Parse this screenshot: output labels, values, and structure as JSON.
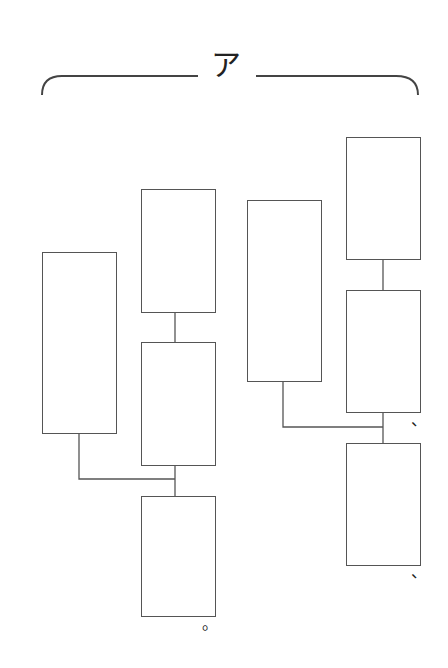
{
  "diagram": {
    "title": "ア",
    "bracket": {
      "type": "curly-bracket",
      "label": "ア"
    },
    "line_color": "#555555",
    "boxes": [
      {
        "id": "left-group-box-1",
        "label": "",
        "x": 42,
        "y": 252,
        "w": 75,
        "h": 182
      },
      {
        "id": "left-group-box-2",
        "label": "",
        "x": 141,
        "y": 189,
        "w": 75,
        "h": 124
      },
      {
        "id": "left-group-box-3",
        "label": "",
        "x": 141,
        "y": 342,
        "w": 75,
        "h": 124
      },
      {
        "id": "left-group-box-4",
        "label": "",
        "x": 141,
        "y": 496,
        "w": 75,
        "h": 121
      },
      {
        "id": "right-group-box-1",
        "label": "",
        "x": 247,
        "y": 200,
        "w": 75,
        "h": 182
      },
      {
        "id": "right-group-box-2",
        "label": "",
        "x": 346,
        "y": 137,
        "w": 75,
        "h": 123
      },
      {
        "id": "right-group-box-3",
        "label": "",
        "x": 346,
        "y": 290,
        "w": 75,
        "h": 123
      },
      {
        "id": "right-group-box-4",
        "label": "",
        "x": 346,
        "y": 443,
        "w": 75,
        "h": 123
      }
    ],
    "punctuation": [
      {
        "id": "period-mark",
        "text": "。"
      },
      {
        "id": "comma-mark-1",
        "text": "、"
      },
      {
        "id": "comma-mark-2",
        "text": "、"
      }
    ]
  }
}
